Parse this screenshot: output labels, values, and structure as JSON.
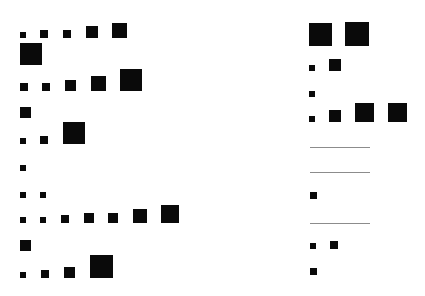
{
  "diagram": {
    "background": "#ffffff",
    "square_color": "#0a0a0a",
    "line_color": "#8c8c8c",
    "columns": [
      {
        "name": "left",
        "rows": [
          {
            "baseline": 38,
            "squares": [
              {
                "x": 20,
                "s": 6
              },
              {
                "x": 40,
                "s": 8
              },
              {
                "x": 63,
                "s": 8
              },
              {
                "x": 86,
                "s": 12
              },
              {
                "x": 112,
                "s": 15
              }
            ]
          },
          {
            "baseline": 65,
            "squares": [
              {
                "x": 20,
                "s": 22
              }
            ]
          },
          {
            "baseline": 91,
            "squares": [
              {
                "x": 20,
                "s": 8
              },
              {
                "x": 42,
                "s": 8
              },
              {
                "x": 65,
                "s": 11
              },
              {
                "x": 91,
                "s": 15
              },
              {
                "x": 120,
                "s": 22
              }
            ]
          },
          {
            "baseline": 118,
            "squares": [
              {
                "x": 20,
                "s": 11
              }
            ]
          },
          {
            "baseline": 144,
            "squares": [
              {
                "x": 20,
                "s": 6
              },
              {
                "x": 40,
                "s": 8
              },
              {
                "x": 63,
                "s": 22
              }
            ]
          },
          {
            "baseline": 171,
            "squares": [
              {
                "x": 20,
                "s": 6
              }
            ]
          },
          {
            "baseline": 198,
            "squares": [
              {
                "x": 20,
                "s": 6
              },
              {
                "x": 40,
                "s": 6
              }
            ]
          },
          {
            "baseline": 223,
            "squares": [
              {
                "x": 20,
                "s": 6
              },
              {
                "x": 40,
                "s": 6
              },
              {
                "x": 61,
                "s": 8
              },
              {
                "x": 84,
                "s": 10
              },
              {
                "x": 108,
                "s": 10
              },
              {
                "x": 133,
                "s": 14
              },
              {
                "x": 161,
                "s": 18
              }
            ]
          },
          {
            "baseline": 251,
            "squares": [
              {
                "x": 20,
                "s": 11
              }
            ]
          },
          {
            "baseline": 278,
            "squares": [
              {
                "x": 20,
                "s": 6
              },
              {
                "x": 41,
                "s": 8
              },
              {
                "x": 64,
                "s": 11
              },
              {
                "x": 90,
                "s": 23
              }
            ]
          }
        ]
      },
      {
        "name": "right",
        "rows": [
          {
            "baseline": 46,
            "squares": [
              {
                "x": 309,
                "s": 23
              },
              {
                "x": 345,
                "s": 24
              }
            ]
          },
          {
            "baseline": 71,
            "squares": [
              {
                "x": 309,
                "s": 6
              },
              {
                "x": 329,
                "s": 12
              }
            ]
          },
          {
            "baseline": 97,
            "squares": [
              {
                "x": 309,
                "s": 6
              }
            ]
          },
          {
            "baseline": 122,
            "squares": [
              {
                "x": 309,
                "s": 6
              },
              {
                "x": 329,
                "s": 12
              },
              {
                "x": 355,
                "s": 19
              },
              {
                "x": 388,
                "s": 19
              }
            ]
          },
          {
            "baseline": 148,
            "line": {
              "x": 310,
              "w": 60
            }
          },
          {
            "baseline": 173,
            "line": {
              "x": 310,
              "w": 60
            }
          },
          {
            "baseline": 199,
            "squares": [
              {
                "x": 310,
                "s": 7
              }
            ]
          },
          {
            "baseline": 224,
            "line": {
              "x": 310,
              "w": 60
            }
          },
          {
            "baseline": 249,
            "squares": [
              {
                "x": 310,
                "s": 6
              },
              {
                "x": 330,
                "s": 8
              }
            ]
          },
          {
            "baseline": 275,
            "squares": [
              {
                "x": 310,
                "s": 7
              }
            ]
          }
        ]
      }
    ]
  }
}
